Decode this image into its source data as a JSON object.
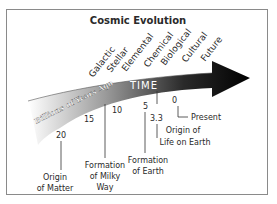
{
  "title": "Cosmic Evolution",
  "arrow_label": "TIME",
  "axis_label": "Billions of Years Ago",
  "eras": [
    "Galactic",
    "Stellar",
    "Elemental",
    "Chemical",
    "Biological",
    "Cultural",
    "Future"
  ],
  "ticks": [
    {
      "value": "20"
    },
    {
      "value": "15"
    },
    {
      "value": "10"
    },
    {
      "value": "5"
    },
    {
      "value": "3.3"
    },
    {
      "value": "0"
    }
  ],
  "events": [
    {
      "line1": "Origin",
      "line2": "of Matter",
      "at": "20"
    },
    {
      "line1": "Formation",
      "line2": "of Milky",
      "line3": "Way",
      "at": "~12"
    },
    {
      "line1": "Formation",
      "line2": "of Earth",
      "at": "5"
    },
    {
      "line1": "Origin of",
      "line2": "Life on Earth",
      "at": "3.3"
    },
    {
      "line1": "Present",
      "at": "0"
    }
  ],
  "colors": {
    "arrow_dark": "#000000",
    "arrow_light": "#ffffff",
    "border": "#8a8a8a",
    "text": "#2a2a2a"
  }
}
